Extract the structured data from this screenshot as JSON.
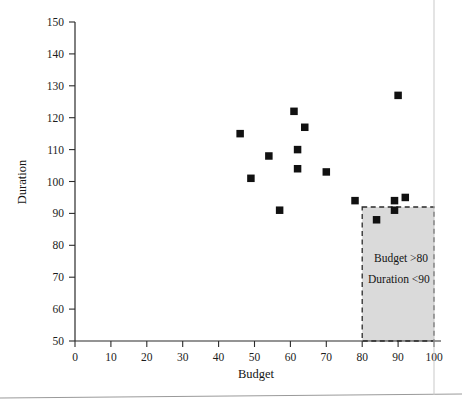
{
  "chart_data": {
    "type": "scatter",
    "title": "",
    "xlabel": "Budget",
    "ylabel": "Duration",
    "xlim": [
      0,
      100
    ],
    "ylim": [
      50,
      150
    ],
    "xticks": [
      0,
      10,
      20,
      30,
      40,
      50,
      60,
      70,
      80,
      90,
      100
    ],
    "yticks": [
      50,
      60,
      70,
      80,
      90,
      100,
      110,
      120,
      130,
      140,
      150
    ],
    "grid": false,
    "legend": null,
    "marker_style": "filled-square",
    "marker_color": "#111111",
    "points": [
      {
        "x": 46,
        "y": 115
      },
      {
        "x": 49,
        "y": 101
      },
      {
        "x": 54,
        "y": 108
      },
      {
        "x": 57,
        "y": 91
      },
      {
        "x": 61,
        "y": 122
      },
      {
        "x": 62,
        "y": 110
      },
      {
        "x": 62,
        "y": 104
      },
      {
        "x": 64,
        "y": 117
      },
      {
        "x": 70,
        "y": 103
      },
      {
        "x": 78,
        "y": 94
      },
      {
        "x": 84,
        "y": 88
      },
      {
        "x": 89,
        "y": 94
      },
      {
        "x": 89,
        "y": 91
      },
      {
        "x": 92,
        "y": 95
      },
      {
        "x": 90,
        "y": 127
      }
    ],
    "annotations": [
      {
        "type": "region",
        "name": "highlight-region",
        "x_range": [
          80,
          100
        ],
        "y_range": [
          50,
          92
        ],
        "fill": "#d4d4d4",
        "border": "dashed",
        "label_lines": [
          "Budget >80",
          "Duration <90"
        ]
      }
    ]
  },
  "axes": {
    "x": {
      "label": "Budget",
      "tick_labels": [
        "0",
        "10",
        "20",
        "30",
        "40",
        "50",
        "60",
        "70",
        "80",
        "90",
        "100"
      ]
    },
    "y": {
      "label": "Duration",
      "tick_labels": [
        "50",
        "60",
        "70",
        "80",
        "90",
        "100",
        "110",
        "120",
        "130",
        "140",
        "150"
      ]
    }
  },
  "region_text": {
    "line1": "Budget >80",
    "line2": "Duration <90"
  }
}
